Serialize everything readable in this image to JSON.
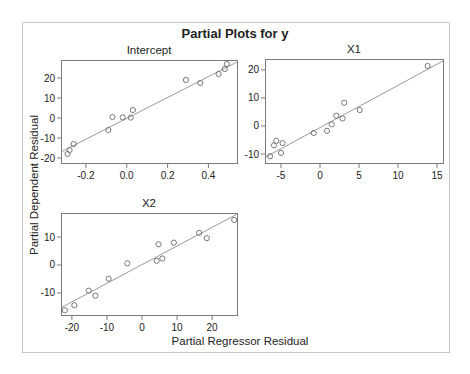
{
  "chart_data": {
    "type": "scatter",
    "title": "Partial Plots for y",
    "ylabel": "Partial Dependent Residual",
    "xlabel": "Partial Regressor Residual",
    "panels": [
      {
        "name": "Intercept",
        "title": "Intercept",
        "box": [
          61,
          60,
          237,
          163
        ],
        "xlim": [
          -0.322,
          0.54
        ],
        "ylim": [
          -22.5,
          29
        ],
        "xticks": [
          -0.2,
          0.0,
          0.2,
          0.4
        ],
        "xtick_labels": [
          "-0.2",
          "0.0",
          "0.2",
          "0.4"
        ],
        "yticks": [
          -20,
          -10,
          0,
          10,
          20
        ],
        "ytick_labels": [
          "-20",
          "-10",
          "0",
          "10",
          "20"
        ],
        "points": [
          [
            -0.29,
            -18
          ],
          [
            -0.28,
            -16
          ],
          [
            -0.26,
            -13
          ],
          [
            -0.09,
            -6
          ],
          [
            -0.07,
            0.5
          ],
          [
            -0.02,
            0.3
          ],
          [
            0.02,
            0.2
          ],
          [
            0.03,
            4
          ],
          [
            0.29,
            19
          ],
          [
            0.36,
            17.5
          ],
          [
            0.45,
            22
          ],
          [
            0.48,
            24.5
          ],
          [
            0.49,
            27
          ]
        ],
        "fit_line": [
          [
            -0.322,
            -17
          ],
          [
            0.54,
            28
          ]
        ]
      },
      {
        "name": "X1",
        "title": "X1",
        "box": [
          265,
          59,
          443,
          163
        ],
        "xlim": [
          -7.05,
          15.77
        ],
        "ylim": [
          -13.2,
          23.9
        ],
        "xticks": [
          -5,
          0,
          5,
          10,
          15
        ],
        "xtick_labels": [
          "-5",
          "0",
          "5",
          "10",
          "15"
        ],
        "yticks": [
          -10,
          0,
          10,
          20
        ],
        "ytick_labels": [
          "-10",
          "0",
          "10",
          "20"
        ],
        "points": [
          [
            -6.4,
            -10.8
          ],
          [
            -5.9,
            -6.9
          ],
          [
            -5.6,
            -5.3
          ],
          [
            -5.0,
            -9.6
          ],
          [
            -4.8,
            -6.1
          ],
          [
            -0.8,
            -2.5
          ],
          [
            0.9,
            -1.7
          ],
          [
            1.5,
            0.6
          ],
          [
            2.1,
            3.7
          ],
          [
            2.9,
            2.7
          ],
          [
            3.1,
            8.3
          ],
          [
            5.1,
            5.7
          ],
          [
            13.8,
            21.4
          ]
        ],
        "fit_line": [
          [
            -7.05,
            -11.2
          ],
          [
            15.77,
            23.2
          ]
        ]
      },
      {
        "name": "X2",
        "title": "X2",
        "box": [
          61,
          213,
          237,
          315
        ],
        "xlim": [
          -23.1,
          27.1
        ],
        "ylim": [
          -17.9,
          18.6
        ],
        "xticks": [
          -20,
          -10,
          0,
          10,
          20
        ],
        "xtick_labels": [
          "-20",
          "-10",
          "0",
          "10",
          "20"
        ],
        "yticks": [
          -10,
          0,
          10
        ],
        "ytick_labels": [
          "-10",
          "0",
          "10"
        ],
        "points": [
          [
            -22,
            -16.2
          ],
          [
            -19.3,
            -14.4
          ],
          [
            -15.2,
            -9.2
          ],
          [
            -13.3,
            -11.0
          ],
          [
            -9.5,
            -4.9
          ],
          [
            -4.2,
            0.6
          ],
          [
            4.2,
            1.5
          ],
          [
            4.7,
            7.4
          ],
          [
            5.8,
            2.3
          ],
          [
            9.1,
            8.0
          ],
          [
            16.3,
            11.5
          ],
          [
            18.5,
            9.6
          ],
          [
            26.3,
            16.1
          ]
        ],
        "fit_line": [
          [
            -23.1,
            -15.3
          ],
          [
            27.1,
            18.2
          ]
        ]
      }
    ],
    "grid": false,
    "legend": null
  },
  "colors": {
    "frame": "#c8c8c8",
    "axis": "#7a7a7a",
    "marker": "#6a6a6a",
    "fit_line": "#9a9a9a",
    "text": "#222222"
  }
}
